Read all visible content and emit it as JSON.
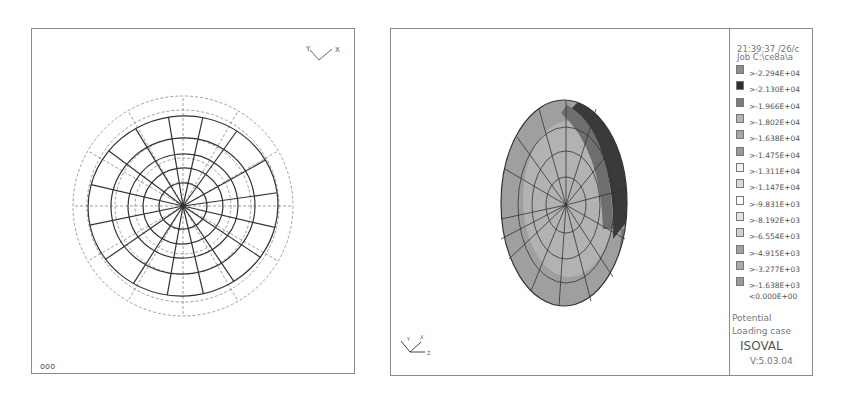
{
  "left_view": {
    "axis_labels": {
      "y": "Y",
      "x": "X"
    },
    "corner_text": "ooo"
  },
  "right_view": {
    "axis_labels": {
      "y": "Y",
      "x": "X",
      "z": "Z"
    },
    "legend": {
      "header_line1": "21:39:37 /26/c",
      "header_line2": "Job    C:\\ce8a\\a",
      "items": [
        {
          "label": ">-2.294E+04",
          "color": "#8d8d8d"
        },
        {
          "label": ">-2.130E+04",
          "color": "#2e2e2e"
        },
        {
          "label": ">-1.966E+04",
          "color": "#7d7d7d"
        },
        {
          "label": ">-1.802E+04",
          "color": "#b5b5b5"
        },
        {
          "label": ">-1.638E+04",
          "color": "#a6a6a6"
        },
        {
          "label": ">-1.475E+04",
          "color": "#999999"
        },
        {
          "label": ">-1.311E+04",
          "color": "#f2f2f2"
        },
        {
          "label": ">-1.147E+04",
          "color": "#d9d9d9"
        },
        {
          "label": ">-9.831E+03",
          "color": "#fafafa"
        },
        {
          "label": ">-8.192E+03",
          "color": "#e3e3e3"
        },
        {
          "label": ">-6.554E+03",
          "color": "#d0d0d0"
        },
        {
          "label": ">-4.915E+03",
          "color": "#a0a0a0"
        },
        {
          "label": ">-3.277E+03",
          "color": "#a9a9a9"
        },
        {
          "label": ">-1.638E+03",
          "color": "#9a9a9a"
        }
      ],
      "below_min": "<0.000E+00",
      "quantity": "Potential",
      "loading_case": "Loading case",
      "program": "ISOVAL",
      "version": "V:5.03.04"
    }
  }
}
